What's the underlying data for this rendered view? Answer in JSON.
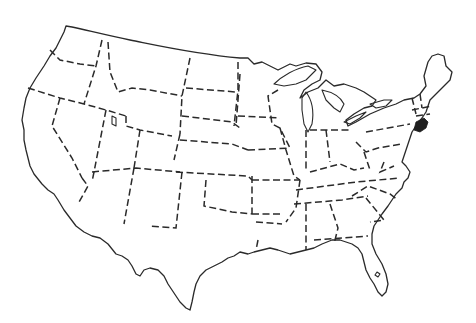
{
  "map": {
    "subject": "Contiguous United States outline map",
    "style": "black outline, dashed state borders, white fill",
    "highlighted_state": {
      "name": "New Jersey",
      "fill": "#1f1f1f"
    },
    "colors": {
      "background": "#ffffff",
      "line": "#2a2a2a",
      "highlight": "#1f1f1f"
    }
  }
}
